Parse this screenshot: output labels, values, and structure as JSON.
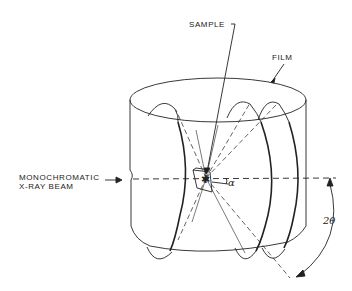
{
  "diagram": {
    "type": "Debye-Scherrer powder camera schematic",
    "labels": {
      "sample": "SAMPLE",
      "film": "FILM",
      "beam_line1": "MONOCHROMATIC",
      "beam_line2": "X-RAY BEAM",
      "alpha": "α",
      "two_theta": "2θ"
    },
    "colors": {
      "line": "#222222",
      "background": "#ffffff"
    }
  }
}
